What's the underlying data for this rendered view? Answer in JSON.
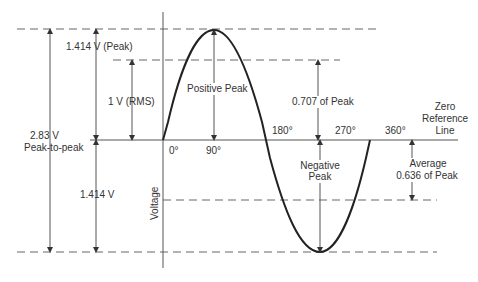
{
  "diagram": {
    "axis_label": "Voltage",
    "zero_reference": [
      "Zero",
      "Reference",
      "Line"
    ],
    "angles": [
      "0°",
      "90°",
      "180°",
      "270°",
      "360°"
    ],
    "labels": {
      "peak": "1.414 V (Peak)",
      "rms": "1 V (RMS)",
      "p2p_value": "2.83 V",
      "p2p_text": "Peak-to-peak",
      "neg_peak_value": "1.414 V",
      "positive_peak": "Positive Peak",
      "rms_fraction": "0.707 of Peak",
      "negative_peak_1": "Negative",
      "negative_peak_2": "Peak",
      "average_1": "Average",
      "average_2": "0.636 of Peak"
    },
    "colors": {
      "line": "#222222",
      "dim": "#555555",
      "text": "#333333"
    }
  }
}
